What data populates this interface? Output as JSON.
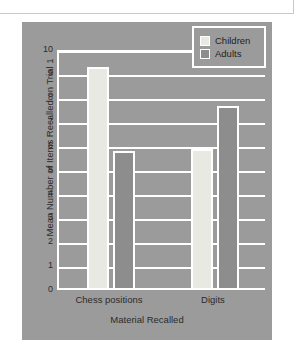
{
  "chart_data": {
    "type": "bar",
    "title": "",
    "xlabel": "Material Recalled",
    "ylabel": "Mean Number of Items Recalled on Trial 1",
    "categories": [
      "Chess positions",
      "Digits"
    ],
    "series": [
      {
        "name": "Children",
        "values": [
          9.2,
          5.8
        ],
        "color": "#e9e9e4"
      },
      {
        "name": "Adults",
        "values": [
          5.7,
          7.6
        ],
        "color": "#8d8d8d"
      }
    ],
    "ylim": [
      0,
      10
    ],
    "yticks": [
      "0",
      "1",
      "2",
      "3",
      "4",
      "5",
      "6",
      "7",
      "8",
      "9",
      "10"
    ],
    "grid": true,
    "legend_position": "top-right",
    "legend_entries": [
      "Children",
      "Adults"
    ],
    "panel_color": "#9b9b9b",
    "gridline_color": "#ffffff"
  }
}
